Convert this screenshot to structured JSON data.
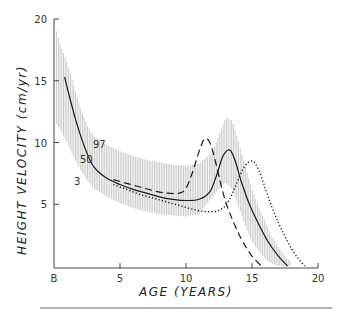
{
  "chart_data": {
    "type": "line",
    "title": "",
    "xlabel": "AGE (YEARS)",
    "ylabel": "HEIGHT VELOCITY (cm/yr)",
    "xlim": [
      0,
      20
    ],
    "ylim": [
      0,
      20
    ],
    "x_ticks": [
      {
        "value": 0,
        "label": "B"
      },
      {
        "value": 5,
        "label": "5"
      },
      {
        "value": 10,
        "label": "10"
      },
      {
        "value": 15,
        "label": "15"
      },
      {
        "value": 20,
        "label": "20"
      }
    ],
    "y_ticks": [
      {
        "value": 5,
        "label": "5"
      },
      {
        "value": 10,
        "label": "10"
      },
      {
        "value": 15,
        "label": "15"
      },
      {
        "value": 20,
        "label": "20"
      }
    ],
    "grid": false,
    "legend": "none",
    "band": {
      "name": "3rd-97th centile range (hatched)",
      "x": [
        0.2,
        0.5,
        1.0,
        1.5,
        2.0,
        2.5,
        3.0,
        4.0,
        5.0,
        6.0,
        7.0,
        8.0,
        9.0,
        10.0,
        11.0,
        12.0,
        12.5,
        13.0,
        13.5,
        14.0,
        14.5,
        15.0,
        15.5,
        16.0,
        16.5,
        17.0,
        17.5,
        18.0
      ],
      "upper": [
        19.0,
        17.8,
        16.5,
        14.6,
        12.8,
        11.4,
        10.5,
        9.8,
        9.3,
        8.9,
        8.6,
        8.4,
        8.2,
        8.1,
        8.3,
        9.2,
        10.6,
        12.0,
        11.8,
        10.0,
        8.0,
        6.2,
        4.8,
        3.6,
        2.4,
        1.5,
        0.8,
        0.3
      ],
      "lower": [
        11.5,
        11.0,
        10.0,
        8.8,
        7.8,
        7.0,
        6.3,
        5.6,
        5.1,
        4.7,
        4.4,
        4.2,
        4.1,
        4.0,
        4.2,
        5.6,
        6.3,
        6.8,
        6.2,
        4.8,
        3.2,
        2.0,
        1.2,
        0.6,
        0.2,
        0.0,
        0.0,
        0.0
      ]
    },
    "series": [
      {
        "name": "50th centile (average)",
        "style": "solid",
        "x": [
          0.8,
          1.2,
          1.6,
          2.0,
          2.4,
          2.8,
          3.2,
          4.0,
          5.0,
          6.0,
          7.0,
          8.0,
          9.0,
          10.0,
          11.0,
          11.8,
          12.3,
          12.8,
          13.3,
          13.7,
          14.2,
          14.8,
          15.5,
          16.2,
          17.0,
          17.7
        ],
        "values": [
          15.3,
          13.6,
          12.0,
          10.6,
          9.4,
          8.4,
          7.8,
          7.1,
          6.6,
          6.2,
          5.9,
          5.6,
          5.4,
          5.3,
          5.4,
          6.0,
          7.3,
          8.9,
          9.4,
          8.6,
          6.8,
          5.0,
          3.4,
          2.0,
          0.8,
          0.0
        ]
      },
      {
        "name": "early maturer",
        "style": "dashed",
        "x": [
          4.5,
          5.5,
          6.5,
          7.5,
          8.5,
          9.5,
          10.0,
          10.5,
          11.0,
          11.4,
          11.8,
          12.2,
          12.6,
          13.0,
          13.5,
          14.0,
          14.5,
          15.0,
          15.7
        ],
        "values": [
          7.0,
          6.7,
          6.4,
          6.1,
          5.9,
          5.9,
          6.3,
          7.6,
          9.3,
          10.3,
          10.0,
          8.6,
          6.8,
          5.2,
          3.8,
          2.6,
          1.6,
          0.8,
          0.0
        ]
      },
      {
        "name": "late maturer",
        "style": "dotted",
        "x": [
          4.5,
          5.5,
          6.5,
          7.5,
          8.5,
          9.5,
          10.5,
          11.5,
          12.5,
          13.2,
          13.8,
          14.4,
          15.0,
          15.5,
          16.0,
          16.5,
          17.0,
          17.5,
          18.0,
          18.5,
          19.0
        ],
        "values": [
          6.6,
          6.2,
          5.8,
          5.5,
          5.2,
          4.9,
          4.6,
          4.4,
          4.5,
          5.2,
          6.6,
          8.0,
          8.5,
          7.8,
          6.3,
          4.8,
          3.5,
          2.4,
          1.4,
          0.6,
          0.0
        ]
      }
    ],
    "annotations": [
      {
        "text": "97",
        "x": 3.2,
        "y": 9.9
      },
      {
        "text": "50",
        "x": 2.4,
        "y": 8.7
      },
      {
        "text": "3",
        "x": 1.8,
        "y": 7.0
      }
    ]
  },
  "labels": {
    "x_axis_title": "AGE (YEARS)",
    "y_axis_title": "HEIGHT VELOCITY (cm/yr)",
    "centile_97": "97",
    "centile_50": "50",
    "centile_3": "3"
  }
}
